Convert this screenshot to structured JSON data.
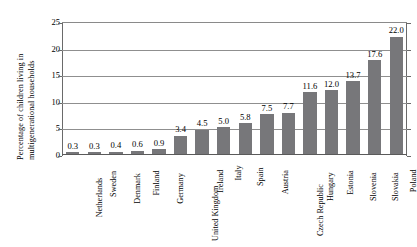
{
  "chart_data": {
    "type": "bar",
    "title": "",
    "xlabel": "",
    "ylabel_lines": [
      "Percentage of children living in",
      "multigenerational households"
    ],
    "ylabel": "Percentage of children living in multigenerational households",
    "ylim": [
      0,
      25
    ],
    "yticks": [
      0,
      5,
      10,
      15,
      20,
      25
    ],
    "ytick_labels": [
      "0",
      "5",
      "10",
      "15",
      "20",
      "25"
    ],
    "grid": true,
    "grid_axis": "y",
    "legend": "none",
    "orientation": "vertical",
    "bar_color": "#77777a",
    "categories": [
      "Netherlands",
      "Sweden",
      "Denmark",
      "Finland",
      "Germany",
      "United Kingdom",
      "Ireland",
      "Italy",
      "Spain",
      "Austria",
      "Czech Republic",
      "Hungary",
      "Estonia",
      "Slovenia",
      "Slovakia",
      "Poland"
    ],
    "values": [
      0.3,
      0.3,
      0.4,
      0.6,
      0.9,
      3.4,
      4.5,
      5.0,
      5.8,
      7.5,
      7.7,
      11.6,
      12.0,
      13.7,
      17.6,
      22.0
    ],
    "value_labels": [
      "0.3",
      "0.3",
      "0.4",
      "0.6",
      "0.9",
      "3.4",
      "4.5",
      "5.0",
      "5.8",
      "7.5",
      "7.7",
      "11.6",
      "12.0",
      "13.7",
      "17.6",
      "22.0"
    ]
  }
}
